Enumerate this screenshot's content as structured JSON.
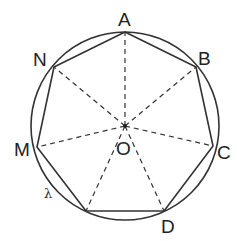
{
  "diagram": {
    "type": "inscribed-heptagon",
    "colors": {
      "stroke": "#333333",
      "background": "#ffffff",
      "text": "#222222"
    },
    "circle": {
      "label": "λ",
      "cx": 125,
      "cy": 126,
      "r": 94
    },
    "center": {
      "label": "O",
      "x": 125,
      "y": 126
    },
    "vertices": [
      {
        "label": "A",
        "x": 125,
        "y": 32
      },
      {
        "label": "B",
        "x": 196,
        "y": 67
      },
      {
        "label": "C",
        "x": 213,
        "y": 146
      },
      {
        "label": "D",
        "x": 164,
        "y": 211
      },
      {
        "label": "",
        "x": 86,
        "y": 211
      },
      {
        "label": "M",
        "x": 37,
        "y": 147
      },
      {
        "label": "N",
        "x": 54,
        "y": 67
      }
    ],
    "labels": {
      "A": "A",
      "B": "B",
      "C": "C",
      "D": "D",
      "M": "M",
      "N": "N",
      "O": "O",
      "lambda": "λ"
    }
  }
}
